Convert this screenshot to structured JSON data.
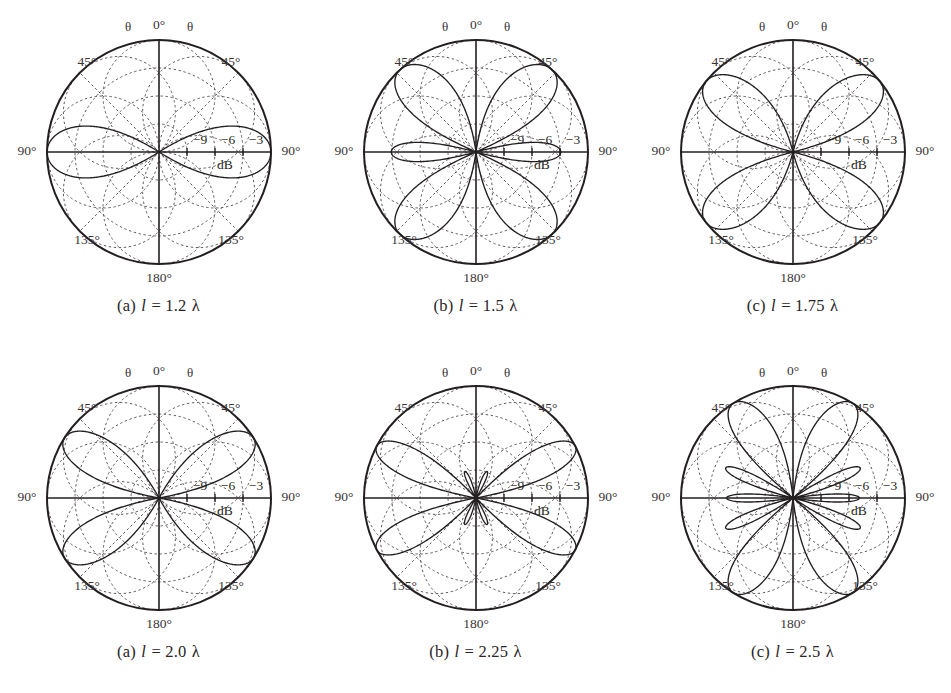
{
  "figure": {
    "background_color": "#ffffff",
    "ink_color": "#231f20",
    "grid_color": "#5d5759"
  },
  "common": {
    "angle_labels": {
      "top": "0°",
      "upper_left": "45°",
      "upper_right": "45°",
      "left": "90°",
      "right": "90°",
      "lower_left": "135°",
      "lower_right": "135°",
      "bottom": "180°"
    },
    "theta_symbol_left": "θ",
    "theta_symbol_right": "θ",
    "ring_labels": [
      "−9",
      "−6",
      "−3"
    ],
    "unit_label": "dB",
    "ring_values_db": [
      -9,
      -6,
      -3
    ],
    "outer_value_db": 0,
    "scale_min_db": -12
  },
  "panels": [
    {
      "id": "panel-a-top",
      "caption_index": "(a)",
      "caption_var": "l",
      "caption_eq": "=",
      "caption_value": "1.2",
      "caption_lambda": "λ",
      "caption_full": "(a) l = 1.2 λ",
      "length_lambda": 1.2
    },
    {
      "id": "panel-b-top",
      "caption_index": "(b)",
      "caption_var": "l",
      "caption_eq": "=",
      "caption_value": "1.5",
      "caption_lambda": "λ",
      "caption_full": "(b) l = 1.5 λ",
      "length_lambda": 1.5
    },
    {
      "id": "panel-c-top",
      "caption_index": "(c)",
      "caption_var": "l",
      "caption_eq": "=",
      "caption_value": "1.75",
      "caption_lambda": "λ",
      "caption_full": "(c) l = 1.75 λ",
      "length_lambda": 1.75
    },
    {
      "id": "panel-a-bottom",
      "caption_index": "(a)",
      "caption_var": "l",
      "caption_eq": "=",
      "caption_value": "2.0",
      "caption_lambda": "λ",
      "caption_full": "(a) l = 2.0 λ",
      "length_lambda": 2.0
    },
    {
      "id": "panel-b-bottom",
      "caption_index": "(b)",
      "caption_var": "l",
      "caption_eq": "=",
      "caption_value": "2.25",
      "caption_lambda": "λ",
      "caption_full": "(b) l = 2.25 λ",
      "length_lambda": 2.25
    },
    {
      "id": "panel-c-bottom",
      "caption_index": "(c)",
      "caption_var": "l",
      "caption_eq": "=",
      "caption_value": "2.5",
      "caption_lambda": "λ",
      "caption_full": "(c) l = 2.5 λ",
      "length_lambda": 2.5
    }
  ],
  "chart_data": [
    {
      "type": "line",
      "subtype": "polar",
      "title": "(a) l = 1.2 λ",
      "xlabel": "θ (degrees)",
      "ylabel": "Relative power (dB)",
      "angular_ticks": [
        0,
        45,
        90,
        135,
        180
      ],
      "angular_tick_labels": [
        "0°",
        "45°",
        "90°",
        "135°",
        "180°"
      ],
      "radial_ticks": [
        -9,
        -6,
        -3,
        0
      ],
      "radial_tick_labels": [
        "−9",
        "−6",
        "−3",
        ""
      ],
      "rlim": [
        -12,
        0
      ],
      "grid": true,
      "legend": "none",
      "series": [
        {
          "name": "l = 1.2 λ",
          "theta_deg": [
            0,
            5,
            10,
            15,
            20,
            25,
            30,
            35,
            40,
            45,
            50,
            55,
            60,
            65,
            70,
            75,
            80,
            85,
            90,
            95,
            100,
            105,
            110,
            115,
            120,
            125,
            130,
            135,
            140,
            145,
            150,
            155,
            160,
            165,
            170,
            175,
            180
          ],
          "values_db": [
            -99,
            -32.4,
            -22.3,
            -17.2,
            -13.8,
            -11.3,
            -9.3,
            -7.7,
            -6.4,
            -5.3,
            -4.4,
            -3.6,
            -2.9,
            -2.3,
            -1.8,
            -1.3,
            -0.9,
            -0.6,
            -0.4,
            -0.6,
            -0.9,
            -1.3,
            -1.8,
            -2.3,
            -2.9,
            -3.6,
            -4.4,
            -5.3,
            -6.4,
            -7.7,
            -9.3,
            -11.3,
            -13.8,
            -17.2,
            -22.3,
            -32.4,
            -99
          ]
        }
      ]
    },
    {
      "type": "line",
      "subtype": "polar",
      "title": "(b) l = 1.5 λ",
      "xlabel": "θ (degrees)",
      "ylabel": "Relative power (dB)",
      "angular_ticks": [
        0,
        45,
        90,
        135,
        180
      ],
      "angular_tick_labels": [
        "0°",
        "45°",
        "90°",
        "135°",
        "180°"
      ],
      "radial_ticks": [
        -9,
        -6,
        -3,
        0
      ],
      "radial_tick_labels": [
        "−9",
        "−6",
        "−3",
        ""
      ],
      "rlim": [
        -12,
        0
      ],
      "grid": true,
      "legend": "none",
      "series": [
        {
          "name": "l = 1.5 λ",
          "theta_deg": [
            0,
            10,
            20,
            30,
            42,
            50,
            60,
            70,
            80,
            90,
            100,
            110,
            120,
            130,
            138,
            150,
            160,
            170,
            180
          ],
          "values_db": [
            -99,
            -14.0,
            -5.0,
            -1.2,
            0.0,
            -1.0,
            -4.6,
            -10.5,
            -16.5,
            -9.6,
            -16.5,
            -10.5,
            -4.6,
            -1.0,
            0.0,
            -1.2,
            -5.0,
            -14.0,
            -99
          ]
        }
      ]
    },
    {
      "type": "line",
      "subtype": "polar",
      "title": "(c) l = 1.75 λ",
      "xlabel": "θ (degrees)",
      "ylabel": "Relative power (dB)",
      "angular_ticks": [
        0,
        45,
        90,
        135,
        180
      ],
      "angular_tick_labels": [
        "0°",
        "45°",
        "90°",
        "135°",
        "180°"
      ],
      "radial_ticks": [
        -9,
        -6,
        -3,
        0
      ],
      "radial_tick_labels": [
        "−9",
        "−6",
        "−3",
        ""
      ],
      "rlim": [
        -12,
        0
      ],
      "grid": true,
      "legend": "none",
      "series": [
        {
          "name": "l = 1.75 λ",
          "theta_deg": [
            0,
            10,
            20,
            30,
            40,
            48,
            55,
            65,
            75,
            85,
            90,
            95,
            105,
            115,
            125,
            132,
            140,
            150,
            160,
            170,
            180
          ],
          "values_db": [
            -99,
            -10.5,
            -3.3,
            -0.7,
            0.0,
            -0.3,
            -1.6,
            -5.3,
            -10.6,
            -16.0,
            -17.0,
            -16.0,
            -10.6,
            -5.3,
            -1.6,
            -0.1,
            -0.7,
            -3.3,
            -10.5,
            -25.0,
            -99
          ]
        }
      ]
    },
    {
      "type": "line",
      "subtype": "polar",
      "title": "(a) l = 2.0 λ",
      "xlabel": "θ (degrees)",
      "ylabel": "Relative power (dB)",
      "angular_ticks": [
        0,
        45,
        90,
        135,
        180
      ],
      "angular_tick_labels": [
        "0°",
        "45°",
        "90°",
        "135°",
        "180°"
      ],
      "radial_ticks": [
        -9,
        -6,
        -3,
        0
      ],
      "radial_tick_labels": [
        "−9",
        "−6",
        "−3",
        ""
      ],
      "rlim": [
        -12,
        0
      ],
      "grid": true,
      "legend": "none",
      "series": [
        {
          "name": "l = 2.0 λ",
          "theta_deg": [
            0,
            10,
            20,
            30,
            40,
            50,
            57,
            65,
            75,
            85,
            90,
            95,
            105,
            115,
            123,
            130,
            140,
            150,
            160,
            170,
            180
          ],
          "values_db": [
            -99,
            -9.0,
            -2.6,
            -0.5,
            0.0,
            -1.0,
            -2.2,
            -5.0,
            -11.0,
            -22.0,
            -99,
            -22.0,
            -11.0,
            -5.0,
            -2.2,
            -1.0,
            0.0,
            -0.5,
            -2.6,
            -9.0,
            -99
          ]
        }
      ]
    },
    {
      "type": "line",
      "subtype": "polar",
      "title": "(b) l = 2.25 λ",
      "xlabel": "θ (degrees)",
      "ylabel": "Relative power (dB)",
      "angular_ticks": [
        0,
        45,
        90,
        135,
        180
      ],
      "angular_tick_labels": [
        "0°",
        "45°",
        "90°",
        "135°",
        "180°"
      ],
      "radial_ticks": [
        -9,
        -6,
        -3,
        0
      ],
      "radial_tick_labels": [
        "−9",
        "−6",
        "−3",
        ""
      ],
      "rlim": [
        -12,
        0
      ],
      "grid": true,
      "legend": "none",
      "series": [
        {
          "name": "l = 2.25 λ",
          "theta_deg": [
            0,
            8,
            16,
            24,
            32,
            40,
            50,
            58,
            66,
            74,
            82,
            90,
            98,
            106,
            114,
            122,
            130,
            140,
            148,
            156,
            164,
            172,
            180
          ],
          "values_db": [
            -99,
            -11.0,
            -9.2,
            -11.5,
            -4.0,
            -1.0,
            0.0,
            -1.5,
            -5.5,
            -11.5,
            -19.0,
            -11.0,
            -19.0,
            -11.5,
            -5.5,
            -1.5,
            0.0,
            -1.0,
            -4.0,
            -11.5,
            -9.2,
            -11.0,
            -99
          ]
        }
      ]
    },
    {
      "type": "line",
      "subtype": "polar",
      "title": "(c) l = 2.5 λ",
      "xlabel": "θ (degrees)",
      "ylabel": "Relative power (dB)",
      "angular_ticks": [
        0,
        45,
        90,
        135,
        180
      ],
      "angular_tick_labels": [
        "0°",
        "45°",
        "90°",
        "135°",
        "180°"
      ],
      "radial_ticks": [
        -9,
        -6,
        -3,
        0
      ],
      "radial_tick_labels": [
        "−9",
        "−6",
        "−3",
        ""
      ],
      "rlim": [
        -12,
        0
      ],
      "grid": true,
      "legend": "none",
      "series": [
        {
          "name": "l = 2.5 λ",
          "theta_deg": [
            0,
            8,
            18,
            28,
            36,
            44,
            52,
            60,
            68,
            76,
            84,
            90,
            96,
            104,
            112,
            120,
            128,
            136,
            144,
            152,
            162,
            172,
            180
          ],
          "values_db": [
            -99,
            -9.0,
            -4.5,
            -11.0,
            -8.0,
            -13.0,
            -3.5,
            -1.0,
            -4.5,
            -9.5,
            -6.5,
            -9.5,
            -6.5,
            -9.5,
            -4.5,
            -1.0,
            -3.5,
            -13.0,
            -8.0,
            -11.0,
            -4.5,
            -9.0,
            -99
          ]
        }
      ]
    }
  ]
}
